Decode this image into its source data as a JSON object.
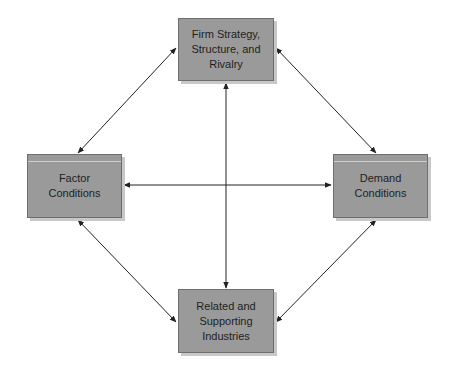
{
  "diagram": {
    "title": "",
    "colors": {
      "box_fill": "#9a9a9a",
      "box_border": "#6e6e6e",
      "box_shadow": "#c8c8c8",
      "arrow": "#222222",
      "background": "#ffffff"
    },
    "nodes": {
      "top": {
        "label": "Firm Strategy,\nStructure, and\nRivalry"
      },
      "left": {
        "label": "Factor\nConditions"
      },
      "right": {
        "label": "Demand\nConditions"
      },
      "bottom": {
        "label": "Related and\nSupporting\nIndustries"
      }
    },
    "edges": [
      {
        "from": "top",
        "to": "left",
        "type": "bidirectional"
      },
      {
        "from": "top",
        "to": "right",
        "type": "bidirectional"
      },
      {
        "from": "top",
        "to": "bottom",
        "type": "bidirectional"
      },
      {
        "from": "left",
        "to": "right",
        "type": "bidirectional"
      },
      {
        "from": "left",
        "to": "bottom",
        "type": "bidirectional"
      },
      {
        "from": "right",
        "to": "bottom",
        "type": "bidirectional"
      }
    ]
  }
}
